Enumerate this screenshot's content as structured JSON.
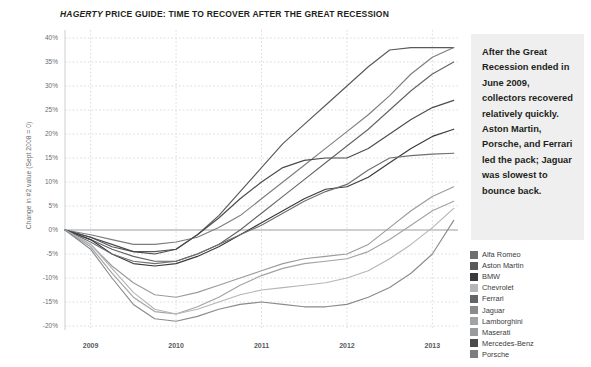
{
  "title": {
    "brand": "HAGERTY",
    "rest": " PRICE GUIDE: TIME TO RECOVER AFTER THE GREAT RECESSION"
  },
  "callout": {
    "text": "After the Great Recession ended in June 2009, collectors recovered relatively quickly. Aston Martin, Porsche, and Ferrari led the pack; Jaguar was slowest to bounce back."
  },
  "legend": {
    "items": [
      {
        "label": "Alfa Romeo",
        "color": "#6e6f71"
      },
      {
        "label": "Aston Martin",
        "color": "#58595b"
      },
      {
        "label": "BMW",
        "color": "#3a3a3c"
      },
      {
        "label": "Chevrolet",
        "color": "#b4b5b7"
      },
      {
        "label": "Ferrari",
        "color": "#636466"
      },
      {
        "label": "Jaguar",
        "color": "#8a8b8d"
      },
      {
        "label": "Lamborghini",
        "color": "#a2a3a5"
      },
      {
        "label": "Maserati",
        "color": "#9a9b9d"
      },
      {
        "label": "Mercedes-Benz",
        "color": "#4a4b4d"
      },
      {
        "label": "Porsche",
        "color": "#7c7d7f"
      }
    ]
  },
  "chart_data": {
    "type": "line",
    "title": "HAGERTY PRICE GUIDE: TIME TO RECOVER AFTER THE GREAT RECESSION",
    "xlabel": "",
    "ylabel": "Change in #2 value (Sept 2008 = 0)",
    "ylim": [
      -20,
      40
    ],
    "ytick_labels": [
      "40%",
      "35%",
      "30%",
      "25%",
      "20%",
      "15%",
      "10%",
      "5%",
      "0%",
      "-5%",
      "-10%",
      "-15%",
      "-20%"
    ],
    "ytick_values": [
      40,
      35,
      30,
      25,
      20,
      15,
      10,
      5,
      0,
      -5,
      -10,
      -15,
      -20
    ],
    "xtick_labels": [
      "2009",
      "2010",
      "2011",
      "2012",
      "2013"
    ],
    "xtick_values": [
      2009,
      2010,
      2011,
      2012,
      2013
    ],
    "xlim": [
      2008.7,
      2013.3
    ],
    "grid": true,
    "legend_position": "right",
    "x": [
      2008.7,
      2009.0,
      2009.25,
      2009.5,
      2009.75,
      2010.0,
      2010.25,
      2010.5,
      2010.75,
      2011.0,
      2011.25,
      2011.5,
      2011.75,
      2012.0,
      2012.25,
      2012.5,
      2012.75,
      2013.0,
      2013.25
    ],
    "series": [
      {
        "name": "Aston Martin",
        "color": "#58595b",
        "values": [
          0,
          -1.5,
          -3.5,
          -4.5,
          -4.5,
          -4.0,
          -1.0,
          3.0,
          8.0,
          13.0,
          18.0,
          22.0,
          26.0,
          30.0,
          34.0,
          37.5,
          38.0,
          38.0,
          38.0
        ]
      },
      {
        "name": "Porsche",
        "color": "#7c7d7f",
        "values": [
          0,
          -1.0,
          -2.0,
          -3.0,
          -3.0,
          -2.5,
          -1.5,
          0.5,
          3.0,
          6.5,
          10.0,
          13.5,
          17.0,
          20.5,
          24.0,
          28.0,
          32.5,
          36.0,
          38.0
        ]
      },
      {
        "name": "Ferrari",
        "color": "#636466",
        "values": [
          0,
          -2.0,
          -4.0,
          -5.5,
          -6.5,
          -6.5,
          -5.0,
          -3.0,
          0.0,
          3.5,
          7.0,
          10.5,
          14.0,
          17.5,
          21.0,
          25.0,
          29.0,
          32.5,
          35.0
        ]
      },
      {
        "name": "Mercedes-Benz",
        "color": "#4a4b4d",
        "values": [
          0,
          -1.5,
          -3.0,
          -4.5,
          -5.0,
          -4.0,
          -1.0,
          2.5,
          6.5,
          10.0,
          13.0,
          14.5,
          15.0,
          15.0,
          17.0,
          20.0,
          23.0,
          25.5,
          27.0
        ]
      },
      {
        "name": "BMW",
        "color": "#3a3a3c",
        "values": [
          0,
          -2.0,
          -5.0,
          -7.0,
          -7.5,
          -7.0,
          -5.5,
          -3.5,
          -1.0,
          1.5,
          4.0,
          6.5,
          8.5,
          9.0,
          11.0,
          14.0,
          17.0,
          19.5,
          21.0
        ]
      },
      {
        "name": "Alfa Romeo",
        "color": "#6e6f71",
        "values": [
          0,
          -2.5,
          -5.0,
          -6.5,
          -7.0,
          -6.5,
          -5.0,
          -3.0,
          -1.0,
          1.0,
          3.5,
          6.0,
          8.0,
          9.5,
          12.5,
          15.0,
          15.5,
          15.8,
          16.0
        ]
      },
      {
        "name": "Maserati",
        "color": "#9a9b9d",
        "values": [
          0,
          -3.0,
          -7.5,
          -11.0,
          -13.5,
          -14.0,
          -13.0,
          -11.5,
          -10.0,
          -8.5,
          -7.0,
          -6.0,
          -5.5,
          -5.0,
          -3.0,
          0.5,
          4.0,
          7.0,
          9.0
        ]
      },
      {
        "name": "Lamborghini",
        "color": "#a2a3a5",
        "values": [
          0,
          -3.5,
          -9.0,
          -14.0,
          -17.0,
          -17.5,
          -16.0,
          -14.0,
          -11.5,
          -9.5,
          -8.0,
          -7.0,
          -6.5,
          -6.0,
          -4.5,
          -2.0,
          1.0,
          4.0,
          6.0
        ]
      },
      {
        "name": "Chevrolet",
        "color": "#b4b5b7",
        "values": [
          0,
          -3.0,
          -8.0,
          -13.0,
          -16.5,
          -17.5,
          -16.5,
          -15.0,
          -13.5,
          -12.5,
          -12.0,
          -11.5,
          -11.0,
          -10.0,
          -8.5,
          -6.0,
          -3.0,
          0.5,
          4.5
        ]
      },
      {
        "name": "Jaguar",
        "color": "#8a8b8d",
        "values": [
          0,
          -4.0,
          -10.0,
          -15.5,
          -18.5,
          -19.0,
          -18.0,
          -16.5,
          -15.5,
          -15.0,
          -15.5,
          -16.0,
          -16.0,
          -15.5,
          -14.0,
          -12.0,
          -9.0,
          -5.0,
          2.0
        ]
      }
    ]
  }
}
